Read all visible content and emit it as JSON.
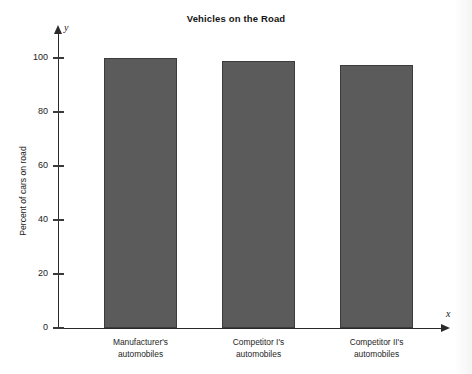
{
  "chart_data": {
    "type": "bar",
    "title": "Vehicles on the Road",
    "xlabel": "",
    "ylabel": "Percent of cars on road",
    "categories": [
      "Manufacturer's automobiles",
      "Competitor I's automobiles",
      "Competitor II's automobiles"
    ],
    "category_lines": [
      [
        "Manufacturer's",
        "automobiles"
      ],
      [
        "Competitor I's",
        "automobiles"
      ],
      [
        "Competitor II's",
        "automobiles"
      ]
    ],
    "values": [
      100,
      99,
      97.5
    ],
    "ylim": [
      0,
      105
    ],
    "yticks": [
      0,
      20,
      40,
      60,
      80,
      100
    ],
    "ytick_labels": [
      "0",
      "20",
      "40",
      "60",
      "80",
      "100"
    ],
    "grid": false,
    "legend": null,
    "axis_markers": {
      "x": "x",
      "y": "y"
    },
    "bar_color": "#5b5b5b",
    "axis_color": "#2a2a2a",
    "background": "#ffffff"
  }
}
